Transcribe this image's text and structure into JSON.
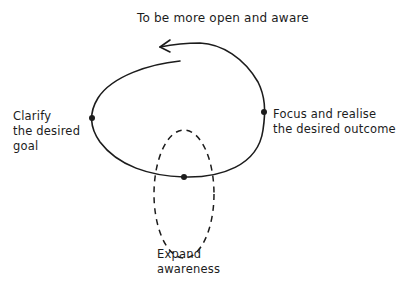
{
  "diagram": {
    "title": "To be more open and aware",
    "nodes": [
      {
        "id": "clarify",
        "lines": [
          "Clarify",
          "the desired",
          "goal"
        ]
      },
      {
        "id": "focus",
        "lines": [
          "Focus and realise",
          "the desired outcome"
        ]
      },
      {
        "id": "expand",
        "lines": [
          "Expand",
          "awareness"
        ]
      }
    ],
    "colors": {
      "ink": "#1c1c1c",
      "background": "#ffffff"
    }
  }
}
